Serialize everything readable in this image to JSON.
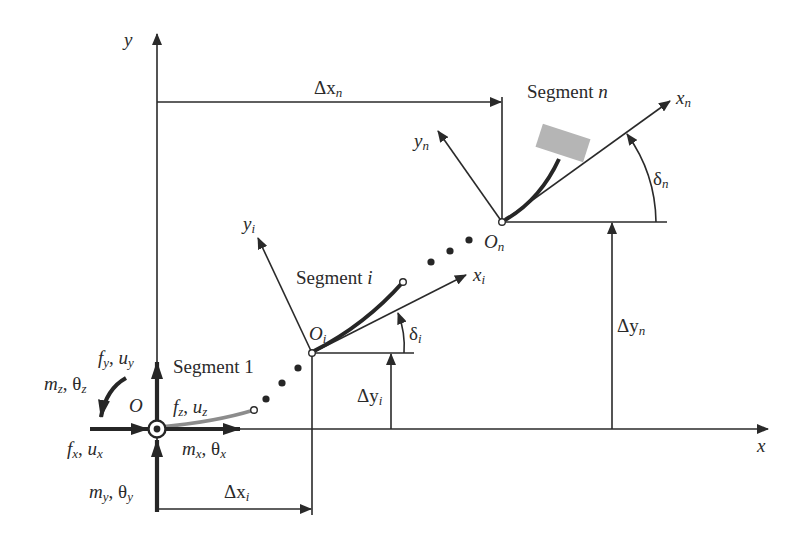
{
  "diagram": {
    "colors": {
      "line": "#2a2a2a",
      "segment_1": "#8c8c8c",
      "end_block": "#b5b5b5",
      "background": "#ffffff"
    },
    "global_axes": {
      "x_label": "x",
      "y_label": "y",
      "origin_label": "O"
    },
    "origin_loads": {
      "fy_uy": {
        "f": "f",
        "fsub": "y",
        "sep": ", ",
        "u": "u",
        "usub": "y"
      },
      "mz_thz": {
        "m": "m",
        "msub": "z",
        "sep": ", ",
        "t": "θ",
        "tsub": "z"
      },
      "fz_uz": {
        "f": "f",
        "fsub": "z",
        "sep": ", ",
        "u": "u",
        "usub": "z"
      },
      "fx_ux": {
        "f": "f",
        "fsub": "x",
        "sep": ", ",
        "u": "u",
        "usub": "x"
      },
      "mx_thx": {
        "m": "m",
        "msub": "x",
        "sep": ", ",
        "t": "θ",
        "tsub": "x"
      },
      "my_thy": {
        "m": "m",
        "msub": "y",
        "sep": ", ",
        "t": "θ",
        "tsub": "y"
      }
    },
    "segments": [
      {
        "label": "Segment 1"
      },
      {
        "label": "Segment ",
        "label_var": "i",
        "origin": {
          "base": "O",
          "sub": "i"
        },
        "x_axis": {
          "base": "x",
          "sub": "i"
        },
        "y_axis": {
          "base": "y",
          "sub": "i"
        },
        "angle": {
          "base": "δ",
          "sub": "i"
        },
        "dx": {
          "base": "Δx",
          "sub": "i"
        },
        "dy": {
          "base": "Δy",
          "sub": "i"
        }
      },
      {
        "label": "Segment ",
        "label_var": "n",
        "origin": {
          "base": "O",
          "sub": "n"
        },
        "x_axis": {
          "base": "x",
          "sub": "n"
        },
        "y_axis": {
          "base": "y",
          "sub": "n"
        },
        "angle": {
          "base": "δ",
          "sub": "n"
        },
        "dx": {
          "base": "Δx",
          "sub": "n"
        },
        "dy": {
          "base": "Δy",
          "sub": "n"
        }
      }
    ]
  }
}
